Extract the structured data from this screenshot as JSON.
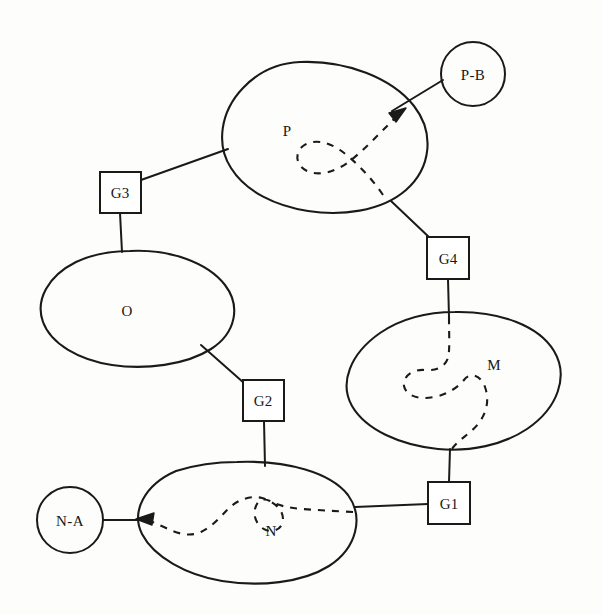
{
  "diagram": {
    "canvas": {
      "width": 602,
      "height": 615,
      "background": "#fdfdfb",
      "ink": "#1a1a18"
    },
    "regions": [
      {
        "id": "P",
        "label": "P",
        "label_x": 287,
        "label_y": 136
      },
      {
        "id": "O",
        "label": "O",
        "label_x": 127,
        "label_y": 316
      },
      {
        "id": "M",
        "label": "M",
        "label_x": 494,
        "label_y": 370
      },
      {
        "id": "N",
        "label": "N",
        "label_x": 271,
        "label_y": 536
      }
    ],
    "terminals": [
      {
        "id": "P-B",
        "label": "P-B",
        "cx": 473,
        "cy": 74,
        "r": 32
      },
      {
        "id": "N-A",
        "label": "N-A",
        "cx": 70,
        "cy": 520,
        "r": 33
      }
    ],
    "gates": [
      {
        "id": "G1",
        "label": "G1",
        "x": 428,
        "y": 482,
        "w": 42,
        "h": 42
      },
      {
        "id": "G2",
        "label": "G2",
        "x": 243,
        "y": 380,
        "w": 41,
        "h": 41
      },
      {
        "id": "G3",
        "label": "G3",
        "x": 100,
        "y": 172,
        "w": 41,
        "h": 41
      },
      {
        "id": "G4",
        "label": "G4",
        "x": 427,
        "y": 237,
        "w": 42,
        "h": 42
      }
    ],
    "connections": [
      {
        "from": "G3",
        "to": "P"
      },
      {
        "from": "G3",
        "to": "O"
      },
      {
        "from": "O",
        "to": "G2"
      },
      {
        "from": "G2",
        "to": "N"
      },
      {
        "from": "P",
        "to": "G4"
      },
      {
        "from": "G4",
        "to": "M"
      },
      {
        "from": "M",
        "to": "G1"
      },
      {
        "from": "G1",
        "to": "N"
      },
      {
        "from": "N",
        "to": "N-A"
      },
      {
        "from": "P",
        "to": "P-B"
      }
    ],
    "flows": [
      {
        "id": "flow-P",
        "through": "P",
        "exit": "P-B",
        "style": "dashed",
        "arrow": true
      },
      {
        "id": "flow-M",
        "through": "M",
        "style": "dashed",
        "arrow": false
      },
      {
        "id": "flow-N",
        "through": "N",
        "exit": "N-A",
        "style": "dashed",
        "arrow": true
      }
    ]
  }
}
